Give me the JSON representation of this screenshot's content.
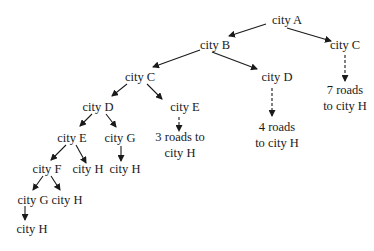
{
  "diagram": {
    "type": "tree",
    "nodes": [
      {
        "id": "A",
        "label": "city A",
        "x": 287,
        "y": 20
      },
      {
        "id": "B",
        "label": "city B",
        "x": 215,
        "y": 45
      },
      {
        "id": "C1",
        "label": "city C",
        "x": 345,
        "y": 45
      },
      {
        "id": "C2",
        "label": "city C",
        "x": 140,
        "y": 77
      },
      {
        "id": "D1",
        "label": "city D",
        "x": 277,
        "y": 77
      },
      {
        "id": "R7",
        "label": "7 roads",
        "label2": "to city H",
        "x": 345,
        "y": 98
      },
      {
        "id": "D2",
        "label": "city D",
        "x": 98,
        "y": 107
      },
      {
        "id": "E1",
        "label": "city E",
        "x": 185,
        "y": 107
      },
      {
        "id": "R4",
        "label": "4 roads",
        "label2": "to city H",
        "x": 277,
        "y": 135
      },
      {
        "id": "R3",
        "label": "3 roads to",
        "label2": "city H",
        "x": 180,
        "y": 145
      },
      {
        "id": "E2",
        "label": "city E",
        "x": 72,
        "y": 138
      },
      {
        "id": "G1",
        "label": "city G",
        "x": 120,
        "y": 138
      },
      {
        "id": "F",
        "label": "city F",
        "x": 47,
        "y": 169
      },
      {
        "id": "H1",
        "label": "city H",
        "x": 88,
        "y": 169
      },
      {
        "id": "H2",
        "label": "city H",
        "x": 125,
        "y": 169
      },
      {
        "id": "G2",
        "label": "city G",
        "x": 33,
        "y": 200
      },
      {
        "id": "H3",
        "label": "city H",
        "x": 67,
        "y": 200
      },
      {
        "id": "H4",
        "label": "city H",
        "x": 32,
        "y": 229
      }
    ],
    "edges": [
      {
        "from": "A",
        "to": "B",
        "style": "solid"
      },
      {
        "from": "A",
        "to": "C1",
        "style": "solid"
      },
      {
        "from": "B",
        "to": "C2",
        "style": "solid"
      },
      {
        "from": "B",
        "to": "D1",
        "style": "solid"
      },
      {
        "from": "C1",
        "to": "R7",
        "style": "dashed"
      },
      {
        "from": "C2",
        "to": "D2",
        "style": "solid"
      },
      {
        "from": "C2",
        "to": "E1",
        "style": "solid"
      },
      {
        "from": "D1",
        "to": "R4",
        "style": "dashed"
      },
      {
        "from": "E1",
        "to": "R3",
        "style": "dashed"
      },
      {
        "from": "D2",
        "to": "E2",
        "style": "solid"
      },
      {
        "from": "D2",
        "to": "G1",
        "style": "solid"
      },
      {
        "from": "E2",
        "to": "F",
        "style": "solid"
      },
      {
        "from": "E2",
        "to": "H1",
        "style": "solid"
      },
      {
        "from": "G1",
        "to": "H2",
        "style": "solid"
      },
      {
        "from": "F",
        "to": "G2",
        "style": "solid"
      },
      {
        "from": "F",
        "to": "H3",
        "style": "solid"
      },
      {
        "from": "G2",
        "to": "H4",
        "style": "solid"
      }
    ]
  }
}
